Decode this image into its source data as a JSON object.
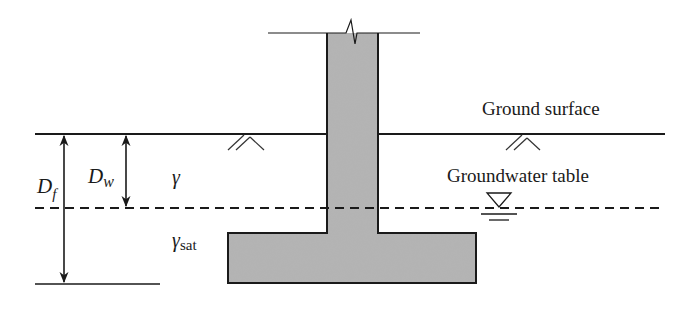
{
  "diagram": {
    "labels": {
      "ground_surface": "Ground surface",
      "groundwater_table": "Groundwater table",
      "depth_foundation_main": "D",
      "depth_foundation_sub": "f",
      "depth_water_main": "D",
      "depth_water_sub": "w",
      "unit_weight": "γ",
      "sat_unit_weight_main": "γ",
      "sat_unit_weight_sub": "sat"
    },
    "elements": {
      "ground_surface_line": {
        "y": 134,
        "x1": 35,
        "x2": 665
      },
      "groundwater_line": {
        "y": 208,
        "x1": 35,
        "x2": 662,
        "style": "dashed"
      },
      "footing_base_line": {
        "y": 284,
        "x1": 35,
        "x2": 160
      },
      "column": {
        "x": 327,
        "y": 33,
        "width": 51,
        "height": 200
      },
      "footing": {
        "x": 228,
        "y": 233,
        "width": 248,
        "height": 50
      },
      "break_line": {
        "y": 33,
        "x1": 268,
        "x2": 420
      },
      "df_arrow": {
        "x": 64,
        "y1": 134,
        "y2": 284
      },
      "dw_arrow": {
        "x": 126,
        "y1": 134,
        "y2": 208
      }
    },
    "colors": {
      "line": "#1a1a1a",
      "concrete_fill": "#b4b4b4",
      "background": "#ffffff"
    }
  }
}
